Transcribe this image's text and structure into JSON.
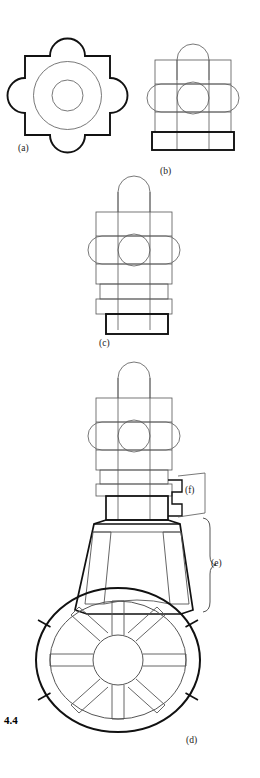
{
  "figure": {
    "number": "4.4",
    "panels": [
      {
        "id": "a",
        "label": "(a)",
        "x": 18,
        "y": 143,
        "description": "plan view: bold square with four semicircular apses and two concentric circles"
      },
      {
        "id": "b",
        "label": "(b)",
        "x": 160,
        "y": 166,
        "description": "elevation: main block with domed top, lateral rounded arms, central circle and bold base plinth"
      },
      {
        "id": "c",
        "label": "(c)",
        "x": 99,
        "y": 338,
        "description": "elevation with two stepped plinths beneath the main block"
      },
      {
        "id": "d",
        "label": "(d)",
        "x": 186,
        "y": 735,
        "description": "full assembly: upper block over flared trapezoidal shaft above an eight-spoke wheel rosette"
      },
      {
        "id": "e",
        "label": "(e)",
        "x": 211,
        "y": 566,
        "description": "brace marking the flared trapezoidal shaft region"
      },
      {
        "id": "f",
        "label": "(f)",
        "x": 185,
        "y": 491,
        "description": "callout box marking the stepped notch detail"
      }
    ],
    "colors": {
      "stroke_bold": "#111111",
      "stroke_thin": "#555555",
      "background": "#ffffff"
    },
    "line_weights": {
      "bold": 2.0,
      "thin": 0.8
    }
  }
}
